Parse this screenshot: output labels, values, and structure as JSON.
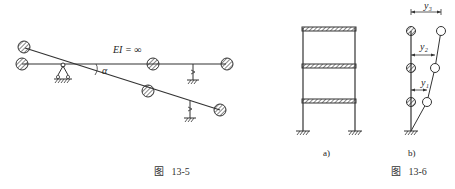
{
  "figure_13_5": {
    "stiffness_label": "EI = ∞",
    "angle_label": "α",
    "caption": "图   13-5"
  },
  "figure_13_6": {
    "sub_a_label": "a)",
    "sub_b_label": "b)",
    "displacements": [
      "y₁",
      "y₂",
      "y₃"
    ],
    "caption": "图   13-6"
  }
}
